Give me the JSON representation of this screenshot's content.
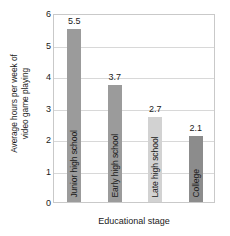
{
  "chart_data": {
    "type": "bar",
    "title": "",
    "subtitle": "",
    "categories": [
      "Junior high school",
      "Early high school",
      "Late high school",
      "College"
    ],
    "values": [
      5.5,
      3.7,
      2.7,
      2.1
    ],
    "value_labels": [
      "5.5",
      "3.7",
      "2.7",
      "2.1"
    ],
    "bar_colors": [
      "#9b9b9b",
      "#9b9b9b",
      "#d2d2d2",
      "#8c8c8c"
    ],
    "xlabel": "Educational stage",
    "ylabel_lines": [
      "Average hours per week of",
      "video game playing"
    ],
    "ylabel": "Average hours per week of video game playing",
    "ylim": [
      0,
      6
    ],
    "ytick_labels": [
      "0",
      "1",
      "2",
      "3",
      "4",
      "5",
      "6"
    ],
    "ytick_values": [
      0,
      1,
      2,
      3,
      4,
      5,
      6
    ],
    "grid": true,
    "grid_color": "#d8d8d8",
    "frame_color": "#c9c9c9",
    "legend": false,
    "legend_position": "none",
    "annotations": []
  }
}
